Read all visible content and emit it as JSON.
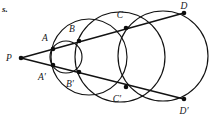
{
  "figure": {
    "corner_text": "s.",
    "background_color": "#ffffff",
    "ink_color": "#121212",
    "width": 218,
    "height": 118
  },
  "labels": {
    "p": "P",
    "a": "A",
    "a_prime": "A′",
    "b": "B",
    "b_prime": "B′",
    "c": "C",
    "c_prime": "C′",
    "d": "D",
    "d_prime": "D′"
  },
  "chart_data": {
    "type": "scatter",
    "xlabel": "",
    "ylabel": "",
    "xlim": [
      0,
      218
    ],
    "ylim": [
      0,
      118
    ],
    "grid": false,
    "legend": "none",
    "annotations": [
      "s."
    ],
    "points": [
      {
        "name": "P",
        "x": 21,
        "y": 58,
        "label": "P",
        "label_x": 9,
        "label_y": 61
      },
      {
        "name": "A",
        "x": 53,
        "y": 49,
        "label": "A",
        "label_x": 45,
        "label_y": 41
      },
      {
        "name": "A'",
        "x": 53,
        "y": 65,
        "label": "A′",
        "label_x": 42,
        "label_y": 80
      },
      {
        "name": "B",
        "x": 79,
        "y": 41,
        "label": "B",
        "label_x": 72,
        "label_y": 32
      },
      {
        "name": "B'",
        "x": 79,
        "y": 72,
        "label": "B′",
        "label_x": 70,
        "label_y": 87
      },
      {
        "name": "C",
        "x": 126,
        "y": 28,
        "label": "C",
        "label_x": 120,
        "label_y": 18
      },
      {
        "name": "C'",
        "x": 126,
        "y": 87,
        "label": "C′",
        "label_x": 117,
        "label_y": 102
      },
      {
        "name": "D",
        "x": 184,
        "y": 13,
        "label": "D",
        "label_x": 184,
        "label_y": 9
      },
      {
        "name": "D'",
        "x": 184,
        "y": 99,
        "label": "D′",
        "label_x": 184,
        "label_y": 114
      }
    ],
    "circles": [
      {
        "name": "circle-small",
        "cx": 66,
        "cy": 57,
        "r": 16
      },
      {
        "name": "circle-medium",
        "cx": 89,
        "cy": 57,
        "r": 38
      },
      {
        "name": "circle-large",
        "cx": 120,
        "cy": 57,
        "r": 45
      },
      {
        "name": "circle-xlarge",
        "cx": 163,
        "cy": 56,
        "r": 45
      }
    ],
    "rays": [
      {
        "name": "upper-ray",
        "x1": 21,
        "y1": 58,
        "x2": 184,
        "y2": 13
      },
      {
        "name": "lower-ray",
        "x1": 21,
        "y1": 58,
        "x2": 184,
        "y2": 99
      }
    ]
  }
}
